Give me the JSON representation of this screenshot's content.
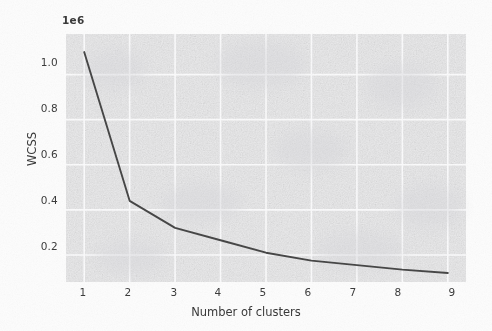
{
  "chart_data": {
    "type": "line",
    "title": "",
    "xlabel": "Number of clusters",
    "ylabel": "WCSS",
    "y_exponent_label": "1e6",
    "x": [
      1,
      2,
      3,
      4,
      5,
      6,
      7,
      8,
      9
    ],
    "series": [
      {
        "name": "WCSS",
        "values": [
          1100000,
          440000,
          320000,
          265000,
          210000,
          175000,
          155000,
          135000,
          120000
        ],
        "color": "#3a3a3a"
      }
    ],
    "xtick_labels": [
      "1",
      "2",
      "3",
      "4",
      "5",
      "6",
      "7",
      "8",
      "9"
    ],
    "ytick_labels": [
      "0.2",
      "0.4",
      "0.6",
      "0.8",
      "1.0"
    ],
    "ytick_values": [
      200000,
      400000,
      600000,
      800000,
      1000000
    ],
    "xlim": [
      0.6,
      9.4
    ],
    "ylim": [
      80000,
      1180000
    ],
    "grid": true,
    "grid_color": "#fbfbfc",
    "plot_background": "#ececed",
    "legend": null,
    "legend_position": "none",
    "annotations": []
  },
  "figure": {
    "background": "#fdfdfd",
    "axis_label_color": "#3a3a3a"
  }
}
